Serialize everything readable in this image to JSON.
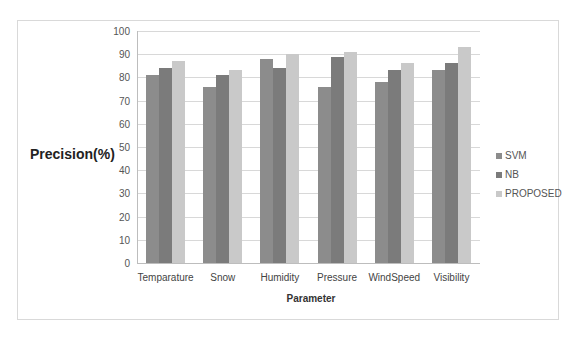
{
  "chart_data": {
    "type": "bar",
    "title": "",
    "xlabel": "Parameter",
    "ylabel": "Precision(%)",
    "ylim": [
      0,
      100
    ],
    "yticks": [
      0,
      10,
      20,
      30,
      40,
      50,
      60,
      70,
      80,
      90,
      100
    ],
    "grid": true,
    "legend_position": "right",
    "categories": [
      "Temparature",
      "Snow",
      "Humidity",
      "Pressure",
      "WindSpeed",
      "Visibility"
    ],
    "series": [
      {
        "name": "SVM",
        "color": "#8c8c8c",
        "values": [
          81,
          76,
          88,
          76,
          78,
          83
        ]
      },
      {
        "name": "NB",
        "color": "#7b7b7b",
        "values": [
          84,
          81,
          84,
          89,
          83,
          86
        ]
      },
      {
        "name": "PROPOSED",
        "color": "#c9c9c9",
        "values": [
          87,
          83,
          90,
          91,
          86,
          93
        ]
      }
    ]
  }
}
